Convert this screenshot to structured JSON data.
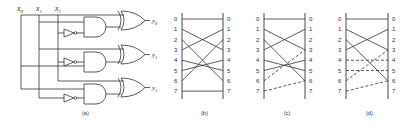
{
  "figure": {
    "panels": [
      {
        "id": "a",
        "caption": "(a)",
        "type": "logic-circuit"
      },
      {
        "id": "b",
        "caption": "(b)",
        "type": "permutation"
      },
      {
        "id": "c",
        "caption": "(c)",
        "type": "permutation"
      },
      {
        "id": "d",
        "caption": "(d)",
        "type": "permutation"
      }
    ],
    "circuit": {
      "inputs": [
        "x",
        "x",
        "x"
      ],
      "input_subs": [
        "0",
        "1",
        "2"
      ],
      "outputs": [
        "y",
        "y",
        "y"
      ],
      "output_subs": [
        "0",
        "1",
        "2"
      ],
      "gates": [
        "NOT",
        "AND",
        "XOR",
        "NOT",
        "AND",
        "XOR",
        "NOT",
        "AND",
        "XOR"
      ]
    },
    "row_labels": [
      "0",
      "1",
      "2",
      "3",
      "4",
      "5",
      "6",
      "7"
    ],
    "permutations": {
      "b": {
        "solid": [
          [
            0,
            0
          ],
          [
            1,
            3
          ],
          [
            2,
            6
          ],
          [
            3,
            1
          ],
          [
            4,
            5
          ],
          [
            5,
            4
          ],
          [
            6,
            2
          ],
          [
            7,
            7
          ]
        ],
        "dashed": []
      },
      "c": {
        "solid": [
          [
            0,
            0
          ],
          [
            1,
            3
          ],
          [
            2,
            6
          ],
          [
            3,
            1
          ],
          [
            4,
            5
          ],
          [
            5,
            4
          ]
        ],
        "dashed": [
          [
            6,
            3
          ],
          [
            7,
            6
          ]
        ]
      },
      "d": {
        "solid": [
          [
            0,
            0
          ],
          [
            1,
            3
          ],
          [
            2,
            6
          ],
          [
            3,
            1
          ]
        ],
        "dashed": [
          [
            4,
            4
          ],
          [
            5,
            5
          ],
          [
            6,
            3
          ],
          [
            7,
            6
          ]
        ]
      }
    },
    "colors": {
      "stroke": "#333333",
      "background": "#ffffff"
    }
  }
}
